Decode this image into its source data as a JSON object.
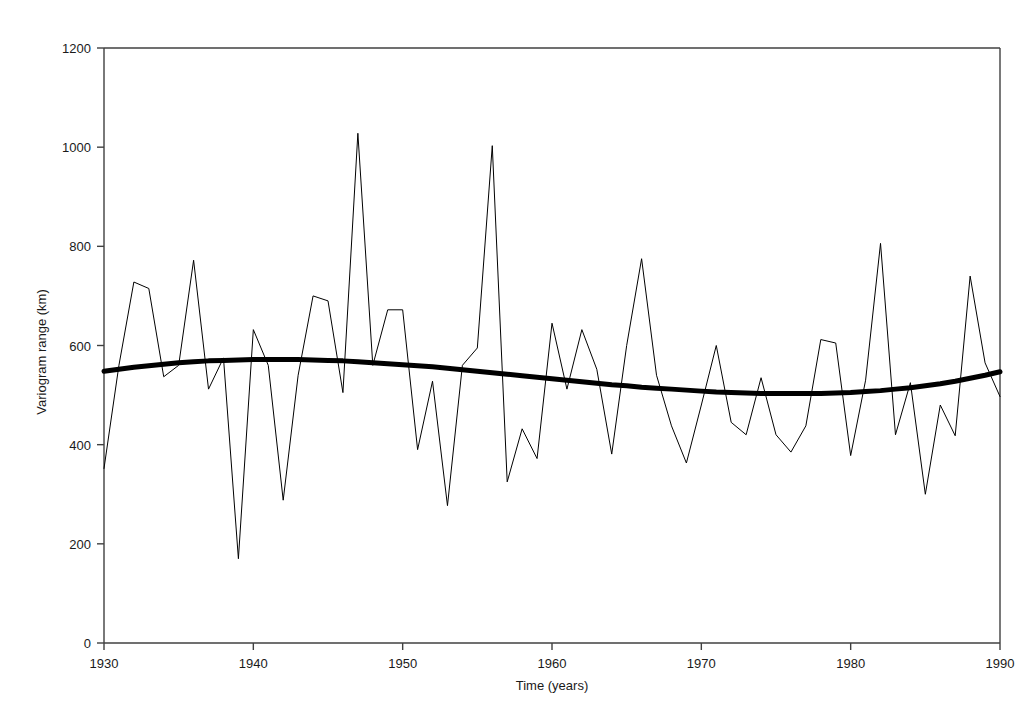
{
  "chart_data": {
    "type": "line",
    "title": "",
    "xlabel": "Time (years)",
    "ylabel": "Variogram range (km)",
    "xlim": [
      1930,
      1990
    ],
    "ylim": [
      0,
      1200
    ],
    "xticks": [
      1930,
      1940,
      1950,
      1960,
      1970,
      1980,
      1990
    ],
    "yticks": [
      0,
      200,
      400,
      600,
      800,
      1000,
      1200
    ],
    "grid": false,
    "legend": "none",
    "frame": "box",
    "x": [
      1930,
      1931,
      1932,
      1933,
      1934,
      1935,
      1936,
      1937,
      1938,
      1939,
      1940,
      1941,
      1942,
      1943,
      1944,
      1945,
      1946,
      1947,
      1948,
      1949,
      1950,
      1951,
      1952,
      1953,
      1954,
      1955,
      1956,
      1957,
      1958,
      1959,
      1960,
      1961,
      1962,
      1963,
      1964,
      1965,
      1966,
      1967,
      1968,
      1969,
      1970,
      1971,
      1972,
      1973,
      1974,
      1975,
      1976,
      1977,
      1978,
      1979,
      1980,
      1981,
      1982,
      1983,
      1984,
      1985,
      1986,
      1987,
      1988,
      1989,
      1990
    ],
    "series": [
      {
        "name": "Variogram range",
        "style": "thin-line",
        "color": "#000000",
        "width": 1,
        "values": [
          352,
          560,
          728,
          715,
          537,
          560,
          772,
          512,
          575,
          170,
          632,
          560,
          288,
          540,
          700,
          690,
          505,
          1028,
          560,
          672,
          672,
          390,
          528,
          277,
          560,
          595,
          1003,
          325,
          432,
          372,
          645,
          512,
          632,
          552,
          381,
          600,
          775,
          540,
          438,
          363,
          480,
          600,
          445,
          420,
          535,
          420,
          385,
          438,
          612,
          605,
          378,
          530,
          806,
          420,
          525,
          300,
          480,
          418,
          740,
          565,
          497
        ]
      },
      {
        "name": "Smoothed trend",
        "style": "thick-line",
        "color": "#000000",
        "width": 5,
        "values": [
          548,
          552,
          556,
          559,
          562,
          565,
          567,
          569,
          570,
          571,
          572,
          572,
          572,
          572,
          571,
          570,
          569,
          567,
          565,
          563,
          561,
          559,
          557,
          554,
          551,
          548,
          545,
          542,
          539,
          536,
          533,
          530,
          527,
          524,
          521,
          519,
          516,
          514,
          512,
          510,
          508,
          506,
          505,
          504,
          503,
          503,
          503,
          503,
          503,
          504,
          505,
          507,
          509,
          512,
          515,
          519,
          523,
          528,
          534,
          540,
          547
        ]
      }
    ]
  }
}
